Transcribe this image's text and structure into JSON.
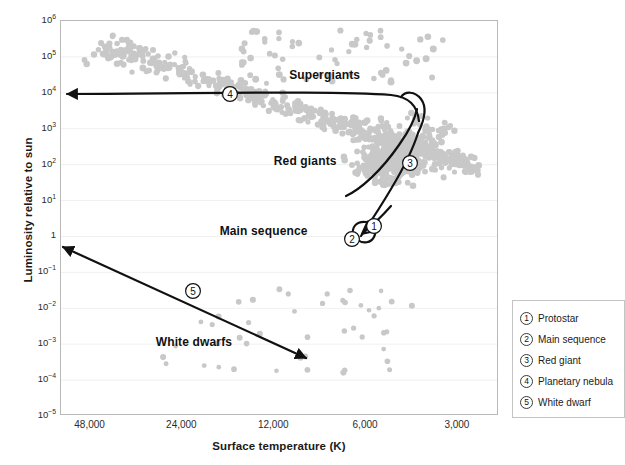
{
  "chart_data": {
    "type": "scatter",
    "title": "",
    "xlabel": "Surface temperature (K)",
    "ylabel": "Luminosity relative to sun",
    "xlim": [
      60000,
      2200
    ],
    "ylim": [
      1e-05,
      1000000.0
    ],
    "xscale": "log-reversed",
    "yscale": "log",
    "grid": true,
    "xticks": [
      "48,000",
      "24,000",
      "12,000",
      "6,000",
      "3,000"
    ],
    "xtick_values": [
      48000,
      24000,
      12000,
      6000,
      3000
    ],
    "yticks": [
      "10⁶",
      "10⁵",
      "10⁴",
      "10³",
      "10²",
      "10¹",
      "1",
      "10⁻¹",
      "10⁻²",
      "10⁻³",
      "10⁻⁴",
      "10⁻⁵"
    ],
    "ytick_values": [
      1000000.0,
      100000.0,
      10000.0,
      1000.0,
      100,
      10,
      1,
      0.1,
      0.01,
      0.001,
      0.0001,
      1e-05
    ],
    "point_color": "#c8c8c8",
    "track_color": "#111111",
    "regions": [
      {
        "label": "Supergiants",
        "x": 8200,
        "y": 30000
      },
      {
        "label": "Red giants",
        "x": 9500,
        "y": 120
      },
      {
        "label": "Main sequence",
        "x": 13000,
        "y": 1.3
      },
      {
        "label": "White dwarfs",
        "x": 22000,
        "y": 0.0011
      }
    ]
  },
  "legend": {
    "items": [
      {
        "num": "1",
        "label": "Protostar"
      },
      {
        "num": "2",
        "label": "Main sequence"
      },
      {
        "num": "3",
        "label": "Red giant"
      },
      {
        "num": "4",
        "label": "Planetary nebula"
      },
      {
        "num": "5",
        "label": "White dwarf"
      }
    ]
  },
  "track_markers": [
    {
      "num": "1",
      "name": "protostar"
    },
    {
      "num": "2",
      "name": "main-sequence"
    },
    {
      "num": "3",
      "name": "red-giant"
    },
    {
      "num": "4",
      "name": "planetary-nebula"
    },
    {
      "num": "5",
      "name": "white-dwarf"
    }
  ]
}
